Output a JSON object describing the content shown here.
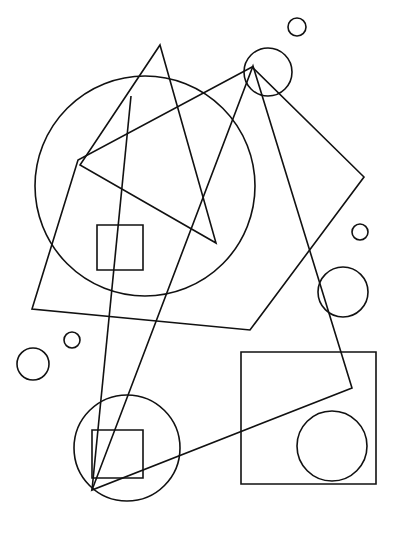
{
  "canvas": {
    "title": "Abstract Geometric Line Drawing",
    "width": 400,
    "height": 541,
    "background_color": "#ffffff",
    "stroke_color": "#111111",
    "stroke_width": 1.6,
    "fill": "none"
  },
  "shapes": [
    {
      "id": "large-circle",
      "name": "large-circle",
      "type": "circle",
      "cx": 145,
      "cy": 186,
      "r": 110
    },
    {
      "id": "large-quadrilateral",
      "name": "large-quadrilateral",
      "type": "polygon",
      "points": "252,67 364,177 250,330 32,309 78,160"
    },
    {
      "id": "upper-triangle",
      "name": "upper-triangle",
      "type": "polygon",
      "points": "160,45 216,243 80,165"
    },
    {
      "id": "lower-triangle",
      "name": "lower-triangle",
      "type": "polygon",
      "points": "253,66 352,388 92,490"
    },
    {
      "id": "long-diagonal-line",
      "name": "long-diagonal-line",
      "type": "line",
      "x1": 131,
      "y1": 96,
      "x2": 92,
      "y2": 490
    },
    {
      "id": "upper-square",
      "name": "upper-square",
      "type": "rect",
      "x": 97,
      "y": 225,
      "width": 46,
      "height": 45
    },
    {
      "id": "bottom-right-square",
      "name": "bottom-right-square",
      "type": "rect",
      "x": 241,
      "y": 352,
      "width": 135,
      "height": 132
    },
    {
      "id": "bottom-right-inner-circle",
      "name": "bottom-right-inner-circle",
      "type": "circle",
      "cx": 332,
      "cy": 446,
      "r": 35
    },
    {
      "id": "bottom-left-circle",
      "name": "bottom-left-circle",
      "type": "circle",
      "cx": 127,
      "cy": 448,
      "r": 53
    },
    {
      "id": "bottom-left-inner-square",
      "name": "bottom-left-inner-square",
      "type": "rect",
      "x": 92,
      "y": 430,
      "width": 51,
      "height": 48
    },
    {
      "id": "top-small-circle",
      "name": "top-small-circle",
      "type": "circle",
      "cx": 297,
      "cy": 27,
      "r": 9
    },
    {
      "id": "diamond-corner-circle",
      "name": "diamond-corner-circle",
      "type": "circle",
      "cx": 268,
      "cy": 72,
      "r": 24
    },
    {
      "id": "right-small-circle",
      "name": "right-small-circle",
      "type": "circle",
      "cx": 360,
      "cy": 232,
      "r": 8
    },
    {
      "id": "right-medium-circle",
      "name": "right-medium-circle",
      "type": "circle",
      "cx": 343,
      "cy": 292,
      "r": 25
    },
    {
      "id": "left-small-circle",
      "name": "left-small-circle",
      "type": "circle",
      "cx": 72,
      "cy": 340,
      "r": 8
    },
    {
      "id": "left-medium-circle",
      "name": "left-medium-circle",
      "type": "circle",
      "cx": 33,
      "cy": 364,
      "r": 16
    }
  ]
}
